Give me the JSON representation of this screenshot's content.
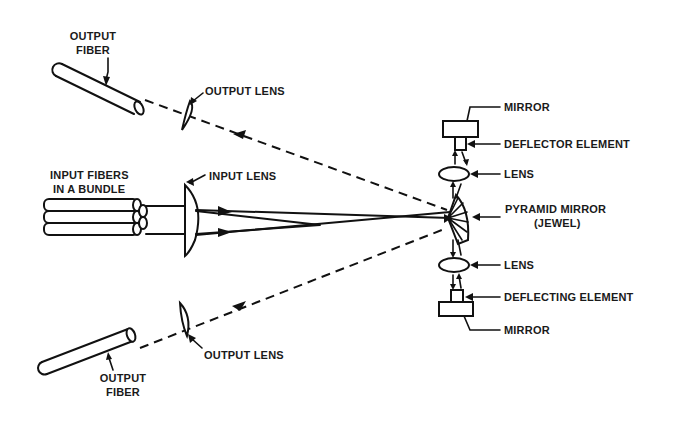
{
  "diagram": {
    "type": "optical-switch-schematic",
    "labels": {
      "output_fiber_top": [
        "OUTPUT",
        "FIBER"
      ],
      "output_lens_top": "OUTPUT LENS",
      "input_fibers": [
        "INPUT FIBERS",
        "IN A BUNDLE"
      ],
      "input_lens": "INPUT LENS",
      "mirror_top": "MIRROR",
      "deflector_element": "DEFLECTOR ELEMENT",
      "lens_top": "LENS",
      "pyramid_mirror": [
        "PYRAMID MIRROR",
        "(JEWEL)"
      ],
      "lens_bottom": "LENS",
      "deflecting_element": "DEFLECTING ELEMENT",
      "mirror_bottom": "MIRROR",
      "output_lens_bottom": "OUTPUT LENS",
      "output_fiber_bottom": [
        "OUTPUT",
        "FIBER"
      ]
    },
    "components": [
      {
        "id": "output-fiber-top",
        "kind": "fiber"
      },
      {
        "id": "output-lens-top",
        "kind": "lens"
      },
      {
        "id": "input-fiber-bundle",
        "kind": "fiber-bundle",
        "count": 3
      },
      {
        "id": "input-lens",
        "kind": "plano-convex-lens"
      },
      {
        "id": "pyramid-mirror",
        "kind": "mirror"
      },
      {
        "id": "lens-top",
        "kind": "lens"
      },
      {
        "id": "deflector-element",
        "kind": "deflector"
      },
      {
        "id": "mirror-top",
        "kind": "mirror"
      },
      {
        "id": "lens-bottom",
        "kind": "lens"
      },
      {
        "id": "deflecting-element",
        "kind": "deflector"
      },
      {
        "id": "mirror-bottom",
        "kind": "mirror"
      },
      {
        "id": "output-lens-bottom",
        "kind": "lens"
      },
      {
        "id": "output-fiber-bottom",
        "kind": "fiber"
      }
    ],
    "edges": [
      {
        "from": "input-fiber-bundle",
        "to": "input-lens",
        "style": "solid"
      },
      {
        "from": "input-lens",
        "to": "pyramid-mirror",
        "style": "solid",
        "arrow": true
      },
      {
        "from": "pyramid-mirror",
        "to": "lens-top",
        "style": "solid",
        "arrow": true
      },
      {
        "from": "pyramid-mirror",
        "to": "lens-bottom",
        "style": "solid",
        "arrow": true
      },
      {
        "from": "pyramid-mirror",
        "to": "output-lens-top",
        "style": "dashed",
        "arrow": true
      },
      {
        "from": "output-lens-top",
        "to": "output-fiber-top",
        "style": "dashed"
      },
      {
        "from": "pyramid-mirror",
        "to": "output-lens-bottom",
        "style": "dashed",
        "arrow": true
      },
      {
        "from": "output-lens-bottom",
        "to": "output-fiber-bottom",
        "style": "dashed"
      }
    ]
  }
}
